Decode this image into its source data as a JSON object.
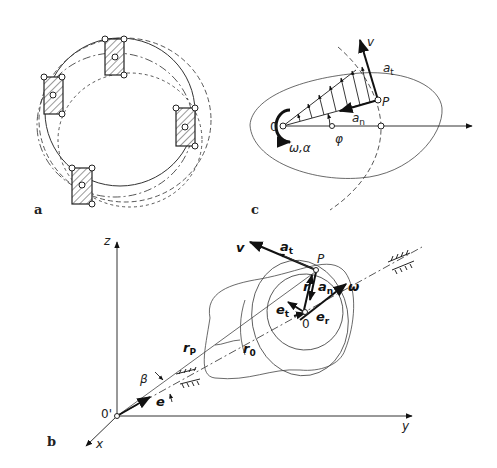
{
  "figure": {
    "panels": [
      {
        "id": "a",
        "label": "a",
        "description": "Rigid body translating along curved paths; four hatched rectangle positions on dashed circular trajectories"
      },
      {
        "id": "b",
        "label": "b",
        "description": "Rotation of rigid body about fixed axis in 3D coordinate system"
      },
      {
        "id": "c",
        "label": "c",
        "description": "Planar rotation about O with velocity distribution and acceleration components at P"
      }
    ],
    "panel_a": {
      "label": "a"
    },
    "panel_b": {
      "label": "b",
      "axes": {
        "z": "z",
        "x": "x",
        "y": "y",
        "origin": "0'"
      },
      "labels": {
        "v": "v",
        "a_t": "a",
        "a_t_sub": "t",
        "P": "P",
        "r": "r",
        "a_n": "a",
        "a_n_sub": "n",
        "omega": "ω",
        "e_t": "e",
        "e_t_sub": "t",
        "e_r": "e",
        "e_r_sub": "r",
        "O": "0",
        "r_0": "r",
        "r_0_sub": "0",
        "r_P": "r",
        "r_P_sub": "P",
        "beta": "β",
        "e": "e"
      }
    },
    "panel_c": {
      "label": "c",
      "labels": {
        "v": "v",
        "a_t": "a",
        "a_t_sub": "t",
        "P": "P",
        "a_n": "a",
        "a_n_sub": "n",
        "O": "0",
        "omega_alpha": "ω,α",
        "phi": "φ"
      }
    }
  }
}
